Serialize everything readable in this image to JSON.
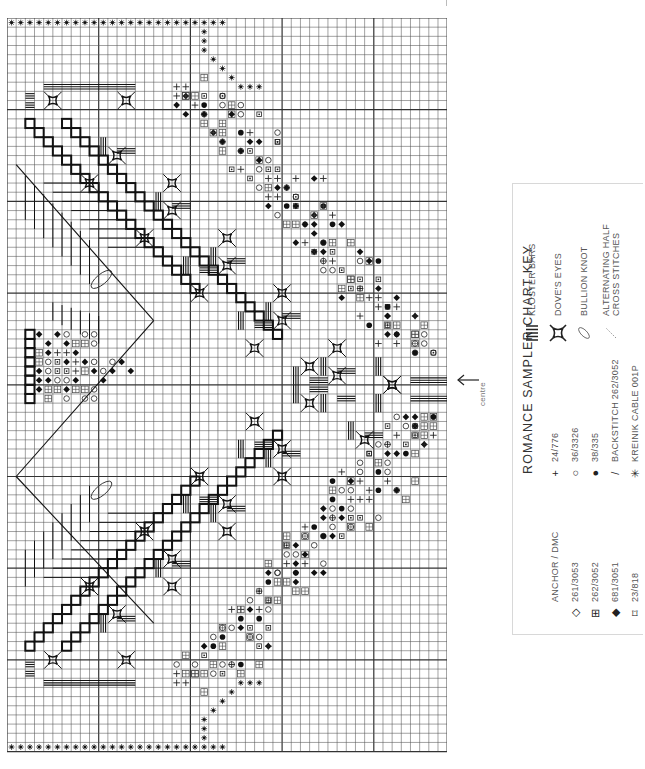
{
  "chart": {
    "grid": {
      "columns": 48,
      "rows": 80,
      "cell_px": 9.17,
      "major_every": 10
    },
    "centre_marker": {
      "label": "centre",
      "arrow": "left-arrow"
    },
    "border_symbol": "kreinik-cable-star"
  },
  "key": {
    "title": "ROMANCE SAMPLER CHART KEY",
    "header": "ANCHOR / DMC",
    "threads": [
      {
        "symbol": "◇",
        "icon": "open-diamond-icon",
        "label": "261/3053"
      },
      {
        "symbol": "⊞",
        "icon": "boxed-plus-icon",
        "label": "262/3052"
      },
      {
        "symbol": "◆",
        "icon": "filled-diamond-icon",
        "label": "681/3051"
      },
      {
        "symbol": "⌑",
        "icon": "square-lozenge-icon",
        "label": "23/818"
      },
      {
        "symbol": "+",
        "icon": "plus-icon",
        "label": "24/776"
      },
      {
        "symbol": "○",
        "icon": "open-circle-icon",
        "label": "36/3326"
      },
      {
        "symbol": "●",
        "icon": "filled-circle-icon",
        "label": "38/335"
      },
      {
        "symbol": "/",
        "icon": "backstitch-line-icon",
        "label": "BACKSTITCH 262/3052"
      },
      {
        "symbol": "✳",
        "icon": "asterisk-star-icon",
        "label": "KREINIK CABLE 001P"
      }
    ],
    "stitches": [
      {
        "icon": "kloster-bars-icon",
        "label": "KLOSTER BARS"
      },
      {
        "icon": "doves-eye-icon",
        "label": "DOVE'S EYES"
      },
      {
        "icon": "bullion-knot-icon",
        "label": "BULLION KNOT"
      },
      {
        "icon": "half-cross-icon",
        "label": "ALTERNATING HALF",
        "label2": "CROSS STITCHES"
      }
    ]
  }
}
